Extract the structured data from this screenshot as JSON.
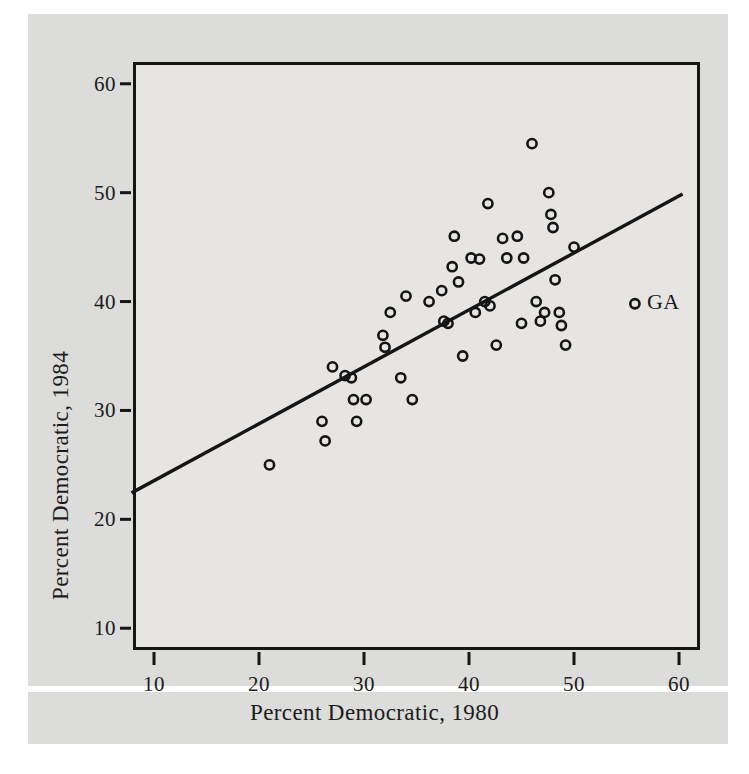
{
  "chart_data": {
    "type": "scatter",
    "title": "",
    "xlabel": "Percent Democratic, 1980",
    "ylabel": "Percent Democratic, 1984",
    "xlim": [
      8,
      62
    ],
    "ylim": [
      8,
      62
    ],
    "xticks": [
      10,
      20,
      30,
      40,
      50,
      60
    ],
    "yticks": [
      10,
      20,
      30,
      40,
      50,
      60
    ],
    "grid": false,
    "legend": null,
    "marker": "open-circle",
    "points": [
      {
        "x": 21.0,
        "y": 25.0
      },
      {
        "x": 26.0,
        "y": 29.0
      },
      {
        "x": 26.3,
        "y": 27.2
      },
      {
        "x": 27.0,
        "y": 34.0
      },
      {
        "x": 28.2,
        "y": 33.2
      },
      {
        "x": 28.8,
        "y": 33.0
      },
      {
        "x": 29.0,
        "y": 31.0
      },
      {
        "x": 29.3,
        "y": 29.0
      },
      {
        "x": 30.2,
        "y": 31.0
      },
      {
        "x": 31.8,
        "y": 36.9
      },
      {
        "x": 32.0,
        "y": 35.8
      },
      {
        "x": 32.5,
        "y": 39.0
      },
      {
        "x": 33.5,
        "y": 33.0
      },
      {
        "x": 34.0,
        "y": 40.5
      },
      {
        "x": 34.6,
        "y": 31.0
      },
      {
        "x": 36.2,
        "y": 40.0
      },
      {
        "x": 37.4,
        "y": 41.0
      },
      {
        "x": 37.6,
        "y": 38.2
      },
      {
        "x": 38.0,
        "y": 38.0
      },
      {
        "x": 38.4,
        "y": 43.2
      },
      {
        "x": 38.6,
        "y": 46.0
      },
      {
        "x": 39.0,
        "y": 41.8
      },
      {
        "x": 39.4,
        "y": 35.0
      },
      {
        "x": 40.2,
        "y": 44.0
      },
      {
        "x": 40.6,
        "y": 39.0
      },
      {
        "x": 41.0,
        "y": 43.9
      },
      {
        "x": 41.5,
        "y": 40.0
      },
      {
        "x": 41.8,
        "y": 49.0
      },
      {
        "x": 42.0,
        "y": 39.6
      },
      {
        "x": 42.6,
        "y": 36.0
      },
      {
        "x": 43.2,
        "y": 45.8
      },
      {
        "x": 43.6,
        "y": 44.0
      },
      {
        "x": 44.6,
        "y": 46.0
      },
      {
        "x": 45.0,
        "y": 38.0
      },
      {
        "x": 45.2,
        "y": 44.0
      },
      {
        "x": 46.0,
        "y": 54.5
      },
      {
        "x": 46.4,
        "y": 40.0
      },
      {
        "x": 46.8,
        "y": 38.2
      },
      {
        "x": 47.2,
        "y": 39.0
      },
      {
        "x": 47.6,
        "y": 50.0
      },
      {
        "x": 47.8,
        "y": 48.0
      },
      {
        "x": 48.0,
        "y": 46.8
      },
      {
        "x": 48.2,
        "y": 42.0
      },
      {
        "x": 48.6,
        "y": 39.0
      },
      {
        "x": 48.8,
        "y": 37.8
      },
      {
        "x": 49.2,
        "y": 36.0
      },
      {
        "x": 50.0,
        "y": 45.0
      },
      {
        "x": 55.8,
        "y": 39.8
      }
    ],
    "fit_line": {
      "label": "regression-line",
      "x_start": 8.0,
      "y_start": 22.5,
      "x_end": 60.2,
      "y_end": 49.8
    },
    "annotations": [
      {
        "label": "GA",
        "x": 55.8,
        "y": 39.8
      }
    ]
  },
  "axes": {
    "x_title": "Percent Democratic, 1980",
    "y_title": "Percent Democratic, 1984",
    "x_tick_labels": [
      "10",
      "20",
      "30",
      "40",
      "50",
      "60"
    ],
    "y_tick_labels": [
      "10",
      "20",
      "30",
      "40",
      "50",
      "60"
    ]
  },
  "colors": {
    "plot_background": "#e6e5e3",
    "plate_background": "#dcdcda",
    "axis": "#151515",
    "marker": "#141414",
    "text": "#1b1b1b"
  }
}
